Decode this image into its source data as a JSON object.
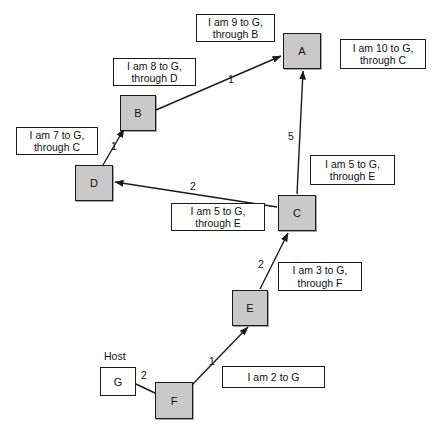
{
  "diagram": {
    "colors": {
      "router_fill": "#c9c9c9",
      "host_fill": "#ffffff",
      "stroke": "#1b1b1b",
      "background": "#ffffff"
    },
    "nodes": [
      {
        "id": "A",
        "label": "A",
        "kind": "router",
        "x": 283,
        "y": 33,
        "w": 38,
        "h": 36
      },
      {
        "id": "B",
        "label": "B",
        "kind": "router",
        "x": 120,
        "y": 95,
        "w": 36,
        "h": 36
      },
      {
        "id": "C",
        "label": "C",
        "kind": "router",
        "x": 278,
        "y": 195,
        "w": 38,
        "h": 36
      },
      {
        "id": "D",
        "label": "D",
        "kind": "router",
        "x": 75,
        "y": 165,
        "w": 38,
        "h": 36
      },
      {
        "id": "E",
        "label": "E",
        "kind": "router",
        "x": 232,
        "y": 290,
        "w": 36,
        "h": 36
      },
      {
        "id": "F",
        "label": "F",
        "kind": "router",
        "x": 155,
        "y": 382,
        "w": 38,
        "h": 37
      },
      {
        "id": "G",
        "label": "G",
        "kind": "host",
        "x": 100,
        "y": 367,
        "w": 36,
        "h": 29
      }
    ],
    "host_caption": {
      "text": "Host",
      "x": 104,
      "y": 350
    },
    "edges": [
      {
        "id": "b-to-a",
        "from": "B",
        "to": "A",
        "weight": "1",
        "arrow": true,
        "x1": 156,
        "y1": 110,
        "x2": 281,
        "y2": 56,
        "wx": 228,
        "wy": 73
      },
      {
        "id": "d-to-b",
        "from": "D",
        "to": "B",
        "weight": "1",
        "arrow": true,
        "x1": 103,
        "y1": 165,
        "x2": 124,
        "y2": 129,
        "wx": 111,
        "wy": 140
      },
      {
        "id": "c-to-d",
        "from": "C",
        "to": "D",
        "weight": "2",
        "arrow": true,
        "x1": 277,
        "y1": 207,
        "x2": 115,
        "y2": 182,
        "wx": 190,
        "wy": 180
      },
      {
        "id": "c-to-a",
        "from": "C",
        "to": "A",
        "weight": "5",
        "arrow": true,
        "x1": 297,
        "y1": 194,
        "x2": 303,
        "y2": 71,
        "wx": 288,
        "wy": 130
      },
      {
        "id": "e-to-c",
        "from": "E",
        "to": "C",
        "weight": "2",
        "arrow": true,
        "x1": 260,
        "y1": 289,
        "x2": 288,
        "y2": 233,
        "wx": 258,
        "wy": 258
      },
      {
        "id": "f-to-e",
        "from": "F",
        "to": "E",
        "weight": "1",
        "arrow": true,
        "x1": 188,
        "y1": 389,
        "x2": 248,
        "y2": 327,
        "wx": 209,
        "wy": 355
      },
      {
        "id": "g-to-f",
        "from": "G",
        "to": "F",
        "weight": "2",
        "arrow": false,
        "x1": 136,
        "y1": 384,
        "x2": 157,
        "y2": 394,
        "wx": 141,
        "wy": 369
      }
    ],
    "messages": [
      {
        "id": "msg-9-b",
        "text": "I am 9 to G,\nthrough B",
        "x": 196,
        "y": 14,
        "w": 79,
        "h": 28
      },
      {
        "id": "msg-10-c",
        "text": "I am 10 to G,\nthrough C",
        "x": 340,
        "y": 39,
        "w": 86,
        "h": 30
      },
      {
        "id": "msg-8-d",
        "text": "I am 8 to G,\nthrough D",
        "x": 113,
        "y": 58,
        "w": 83,
        "h": 28
      },
      {
        "id": "msg-7-c",
        "text": "I am 7 to G,\nthrough C",
        "x": 16,
        "y": 127,
        "w": 82,
        "h": 28
      },
      {
        "id": "msg-5-e-right",
        "text": "I am 5 to G,\nthrough E",
        "x": 310,
        "y": 155,
        "w": 85,
        "h": 30
      },
      {
        "id": "msg-5-e-left",
        "text": "I am 5 to G,\nthrough E",
        "x": 171,
        "y": 203,
        "w": 94,
        "h": 28
      },
      {
        "id": "msg-3-f",
        "text": "I am 3 to G,\nthrough F",
        "x": 278,
        "y": 262,
        "w": 84,
        "h": 29
      },
      {
        "id": "msg-2-g",
        "text": "I am 2 to G",
        "x": 222,
        "y": 366,
        "w": 103,
        "h": 22
      }
    ]
  }
}
